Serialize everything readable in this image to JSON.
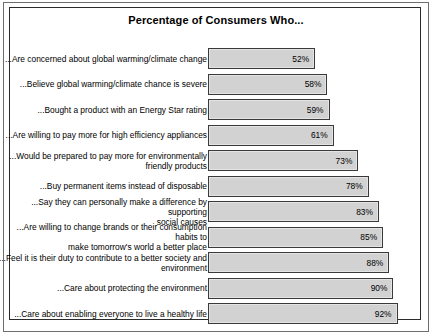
{
  "chart": {
    "title": "Percentage of Consumers Who..."
  },
  "chart_data": {
    "type": "bar",
    "orientation": "horizontal",
    "title": "Percentage of Consumers Who...",
    "subtitle": "",
    "xlabel": "",
    "ylabel": "",
    "xlim": [
      0,
      100
    ],
    "grid": false,
    "legend": false,
    "value_suffix": "%",
    "categories": [
      "...Are concerned about global warming/climate change",
      "...Believe global warming/climate chance is severe",
      "...Bought a product with an Energy Star rating",
      "...Are willing to pay more for high efficiency appliances",
      "...Would be prepared to pay more for environmentally\nfriendly products",
      "...Buy permanent items instead of disposable",
      "...Say they can personally make a difference by supporting\nsocial causes",
      "...Are willing to change brands or their consumption habits to\nmake tomorrow's world a better place",
      "...Feel it is their duty to contribute to a better society and\nenvironment",
      "...Care about protecting the environment",
      "...Care about enabling everyone to live a healthy life"
    ],
    "values": [
      52,
      58,
      59,
      61,
      73,
      78,
      83,
      85,
      88,
      90,
      92
    ],
    "labels": [
      "52%",
      "58%",
      "59%",
      "61%",
      "73%",
      "78%",
      "83%",
      "85%",
      "88%",
      "90%",
      "92%"
    ],
    "colors": {
      "bar_fill": "#d2d2d2",
      "bar_border": "#3a3a3a",
      "frame": "#2b2b2b",
      "outer_frame": "#6e6e6e",
      "text": "#000000",
      "background": "#ffffff"
    }
  }
}
